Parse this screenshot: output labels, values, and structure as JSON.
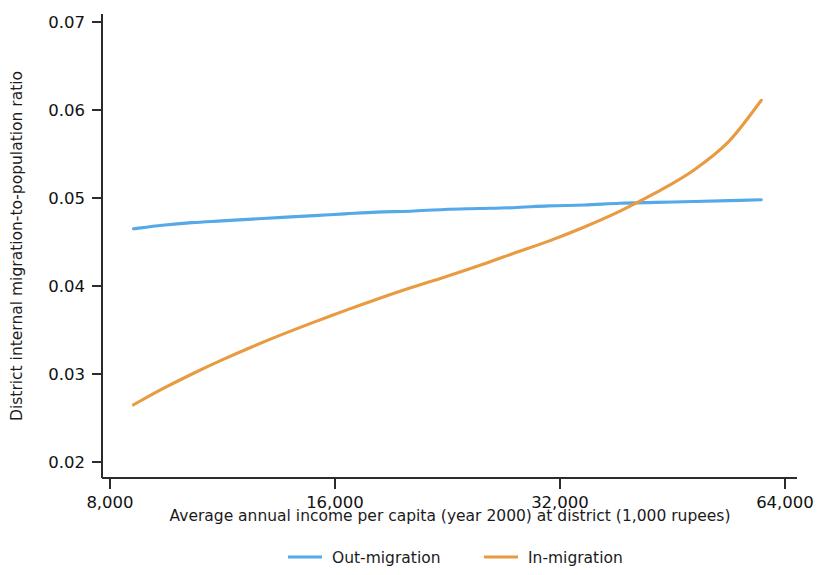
{
  "chart_data": {
    "type": "line",
    "title": "",
    "xlabel": "Average annual income per capita (year 2000) at district (1,000 rupees)",
    "ylabel": "District internal migration-to-population ratio",
    "xscale": "log2",
    "xlim": [
      7600,
      68000
    ],
    "ylim": [
      0.02,
      0.07
    ],
    "xticks": [
      8000,
      16000,
      32000,
      64000
    ],
    "xtick_labels": [
      "8,000",
      "16,000",
      "32,000",
      "64,000"
    ],
    "yticks": [
      0.02,
      0.03,
      0.04,
      0.05,
      0.06,
      0.07
    ],
    "ytick_labels": [
      "0.02",
      "0.03",
      "0.04",
      "0.05",
      "0.06",
      "0.07"
    ],
    "grid": false,
    "legend_position": "bottom-center",
    "x": [
      8600,
      9400,
      10300,
      11300,
      12400,
      13600,
      15000,
      16500,
      18200,
      20200,
      22400,
      24900,
      27700,
      30900,
      34500,
      38500,
      43000,
      48200,
      53800,
      59500
    ],
    "series": [
      {
        "name": "Out-migration",
        "color": "#54A9E8",
        "values": [
          0.0465,
          0.0469,
          0.0472,
          0.0474,
          0.0476,
          0.0478,
          0.048,
          0.0482,
          0.0484,
          0.0485,
          0.0487,
          0.0488,
          0.0489,
          0.0491,
          0.0492,
          0.0494,
          0.0495,
          0.0496,
          0.0497,
          0.0498
        ]
      },
      {
        "name": "In-migration",
        "color": "#E89B41",
        "values": [
          0.0265,
          0.0283,
          0.03,
          0.0316,
          0.0331,
          0.0345,
          0.0359,
          0.0372,
          0.0385,
          0.0398,
          0.041,
          0.0423,
          0.0437,
          0.0451,
          0.0467,
          0.0485,
          0.0506,
          0.0531,
          0.0564,
          0.0611
        ]
      }
    ]
  },
  "legend": {
    "items": [
      {
        "label": "Out-migration",
        "color": "#54A9E8"
      },
      {
        "label": "In-migration",
        "color": "#E89B41"
      }
    ]
  }
}
